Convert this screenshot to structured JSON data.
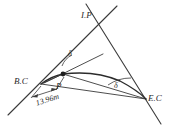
{
  "diagram": {
    "type": "surveying-horizontal-curve",
    "background_color": "#ffffff",
    "line_color": "#3a3a3a",
    "text_color": "#2b2b2b",
    "labels": {
      "intersection_point": "I.P",
      "begin_curve": "B.C",
      "end_curve": "E.C",
      "curve_point": "P",
      "deflection_angle_near_bc": "δ",
      "deflection_angle_near_ec": "δ",
      "dimension_length": "13.96m"
    },
    "points": {
      "I.P": {
        "x": 100,
        "y": 22
      },
      "B.C": {
        "x": 41,
        "y": 84
      },
      "E.C": {
        "x": 146,
        "y": 99
      },
      "P": {
        "x": 63,
        "y": 74
      }
    },
    "annotations": {
      "chord_bc_to_p_length": "13.96m",
      "angle_symbol": "δ",
      "angle_count": 2
    }
  }
}
